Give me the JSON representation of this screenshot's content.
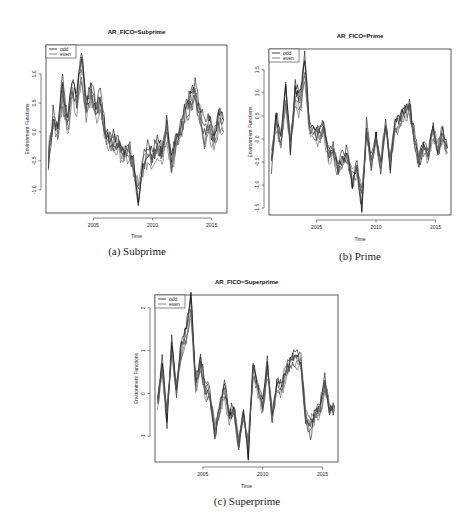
{
  "figure": {
    "panels": [
      {
        "id": "a",
        "title": "AR_FICO=Subprime",
        "caption": "(a) Subprime",
        "xlabel": "Time",
        "ylabel": "Environment Functions",
        "legend": [
          {
            "label": "odd",
            "color": "#111111"
          },
          {
            "label": "even",
            "color": "#666666"
          }
        ]
      },
      {
        "id": "b",
        "title": "AR_FICO=Prime",
        "caption": "(b) Prime",
        "xlabel": "Time",
        "ylabel": "Environment Functions",
        "legend": [
          {
            "label": "odd",
            "color": "#111111"
          },
          {
            "label": "even",
            "color": "#666666"
          }
        ]
      },
      {
        "id": "c",
        "title": "AR_FICO=Superprime",
        "caption": "(c) Superprime",
        "xlabel": "Time",
        "ylabel": "Environment Functions",
        "legend": [
          {
            "label": "odd",
            "color": "#111111"
          },
          {
            "label": "even",
            "color": "#666666"
          }
        ]
      }
    ]
  },
  "chart_data": [
    {
      "type": "line",
      "title": "AR_FICO=Subprime",
      "xlabel": "Time",
      "ylabel": "Environment Functions",
      "xlim": [
        2001,
        2016.3
      ],
      "ylim": [
        -1.4,
        1.5
      ],
      "xticks": [
        2005,
        2010,
        2015
      ],
      "yticks": [
        -1.0,
        -0.5,
        0.0,
        0.5,
        1.0
      ],
      "ytick_labels": [
        "-1.0",
        "-0.5",
        "0.0",
        "0.5",
        "1.0"
      ],
      "legend": [
        "odd",
        "even"
      ],
      "legend_position": "top-left",
      "grid": false,
      "x": [
        2001.2,
        2001.6,
        2002.0,
        2002.4,
        2002.8,
        2003.2,
        2003.6,
        2004.0,
        2004.4,
        2004.8,
        2005.2,
        2005.6,
        2006.0,
        2006.4,
        2006.8,
        2007.2,
        2007.6,
        2008.0,
        2008.4,
        2008.8,
        2009.2,
        2009.6,
        2010.0,
        2010.4,
        2010.8,
        2011.2,
        2011.6,
        2012.0,
        2012.4,
        2012.8,
        2013.2,
        2013.6,
        2014.0,
        2014.4,
        2014.8,
        2015.2,
        2015.6,
        2016.0
      ],
      "series": [
        {
          "name": "odd",
          "values": [
            -0.55,
            0.3,
            0.1,
            0.85,
            0.2,
            0.85,
            0.6,
            1.35,
            0.5,
            0.8,
            0.4,
            0.6,
            0.0,
            -0.1,
            -0.15,
            -0.2,
            -0.35,
            -0.3,
            -0.5,
            -1.25,
            -0.5,
            -0.3,
            -0.4,
            -0.15,
            -0.35,
            0.15,
            -0.5,
            -0.1,
            0.1,
            0.45,
            0.6,
            0.75,
            0.35,
            0.1,
            0.2,
            -0.1,
            0.35,
            0.2
          ]
        },
        {
          "name": "even",
          "values": [
            -0.4,
            0.2,
            -0.1,
            0.6,
            0.0,
            0.7,
            0.4,
            1.0,
            0.35,
            0.6,
            0.3,
            0.45,
            -0.1,
            -0.2,
            -0.25,
            -0.3,
            -0.45,
            -0.4,
            -0.65,
            -1.0,
            -0.6,
            -0.45,
            -0.5,
            -0.3,
            -0.45,
            0.0,
            -0.6,
            -0.25,
            0.0,
            0.3,
            0.45,
            0.6,
            0.2,
            -0.2,
            0.05,
            -0.25,
            0.15,
            0.0
          ]
        }
      ]
    },
    {
      "type": "line",
      "title": "AR_FICO=Prime",
      "xlabel": "Time",
      "ylabel": "Environment Functions",
      "xlim": [
        2001,
        2016.3
      ],
      "ylim": [
        -1.65,
        1.95
      ],
      "xticks": [
        2005,
        2010,
        2015
      ],
      "yticks": [
        -1.5,
        -1.0,
        -0.5,
        0.0,
        0.5,
        1.0,
        1.5
      ],
      "ytick_labels": [
        "-1.5",
        "-1.0",
        "-0.5",
        "0.0",
        "0.5",
        "1.0",
        "1.5"
      ],
      "legend": [
        "odd",
        "even"
      ],
      "legend_position": "top-left",
      "grid": false,
      "x": [
        2001.2,
        2001.6,
        2002.0,
        2002.4,
        2002.8,
        2003.2,
        2003.6,
        2004.0,
        2004.4,
        2004.8,
        2005.2,
        2005.6,
        2006.0,
        2006.4,
        2006.8,
        2007.2,
        2007.6,
        2008.0,
        2008.4,
        2008.8,
        2009.2,
        2009.6,
        2010.0,
        2010.4,
        2010.8,
        2011.2,
        2011.6,
        2012.0,
        2012.4,
        2012.8,
        2013.2,
        2013.6,
        2014.0,
        2014.4,
        2014.8,
        2015.2,
        2015.6,
        2016.0
      ],
      "series": [
        {
          "name": "odd",
          "values": [
            -0.6,
            0.5,
            0.0,
            1.2,
            -0.2,
            1.1,
            0.9,
            1.8,
            0.3,
            0.2,
            0.1,
            0.35,
            -0.3,
            -0.2,
            -0.6,
            -0.4,
            -0.3,
            -1.0,
            -0.5,
            -1.55,
            0.3,
            -0.5,
            0.1,
            -0.6,
            0.4,
            -0.6,
            0.3,
            0.5,
            0.65,
            0.75,
            0.1,
            -0.5,
            -0.1,
            -0.3,
            0.3,
            -0.3,
            0.2,
            -0.2
          ]
        },
        {
          "name": "even",
          "values": [
            -0.4,
            0.3,
            -0.1,
            0.8,
            -0.1,
            0.8,
            0.6,
            1.4,
            0.2,
            0.1,
            0.0,
            0.2,
            -0.4,
            -0.3,
            -0.7,
            -0.5,
            -0.45,
            -0.8,
            -0.7,
            -1.2,
            0.15,
            -0.6,
            0.0,
            -0.5,
            0.3,
            -0.4,
            0.2,
            0.35,
            0.5,
            0.6,
            0.0,
            -0.4,
            -0.2,
            -0.4,
            0.15,
            -0.2,
            0.05,
            -0.3
          ]
        }
      ]
    },
    {
      "type": "line",
      "title": "AR_FICO=Superprime",
      "xlabel": "Time",
      "ylabel": "Environment Functions",
      "xlim": [
        2001,
        2016.3
      ],
      "ylim": [
        -1.6,
        2.3
      ],
      "xticks": [
        2005,
        2010,
        2015
      ],
      "yticks": [
        -1,
        0,
        1,
        2
      ],
      "ytick_labels": [
        "-1",
        "0",
        "1",
        "2"
      ],
      "legend": [
        "odd",
        "even"
      ],
      "legend_position": "top-left",
      "grid": false,
      "x": [
        2001.2,
        2001.6,
        2002.0,
        2002.4,
        2002.8,
        2003.2,
        2003.6,
        2004.0,
        2004.4,
        2004.8,
        2005.2,
        2005.6,
        2006.0,
        2006.4,
        2006.8,
        2007.2,
        2007.6,
        2008.0,
        2008.4,
        2008.8,
        2009.2,
        2009.6,
        2010.0,
        2010.4,
        2010.8,
        2011.2,
        2011.6,
        2012.0,
        2012.4,
        2012.8,
        2013.2,
        2013.6,
        2014.0,
        2014.4,
        2014.8,
        2015.2,
        2015.6,
        2016.0
      ],
      "series": [
        {
          "name": "odd",
          "values": [
            -0.3,
            0.8,
            -0.7,
            1.3,
            0.0,
            1.2,
            1.5,
            2.3,
            0.2,
            0.8,
            0.2,
            0.0,
            -1.0,
            -0.3,
            0.2,
            -0.5,
            -0.3,
            -1.3,
            -0.4,
            -1.45,
            0.7,
            0.2,
            -0.3,
            0.7,
            -0.6,
            0.3,
            0.2,
            0.6,
            0.8,
            0.9,
            0.8,
            -0.6,
            -0.9,
            -0.4,
            -0.3,
            0.3,
            -0.4,
            -0.3
          ]
        },
        {
          "name": "even",
          "values": [
            -0.2,
            0.5,
            -0.4,
            1.0,
            0.1,
            0.9,
            1.2,
            1.9,
            0.1,
            0.6,
            0.0,
            -0.1,
            -0.8,
            -0.4,
            0.0,
            -0.6,
            -0.45,
            -1.1,
            -0.6,
            -1.2,
            0.5,
            0.05,
            -0.4,
            0.5,
            -0.5,
            0.15,
            0.05,
            0.45,
            0.65,
            0.75,
            0.65,
            -0.5,
            -0.7,
            -0.5,
            -0.4,
            0.15,
            -0.3,
            -0.4
          ]
        }
      ]
    }
  ]
}
